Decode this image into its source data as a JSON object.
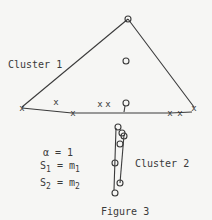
{
  "figure": {
    "caption": "Figure 3",
    "cluster1_label": "Cluster 1",
    "cluster2_label": "Cluster 2",
    "params": {
      "alpha": "α = 1",
      "s1_base": "S",
      "s1_sub": "1",
      "s1_eq": " = m",
      "s1_rhs_sub": "1",
      "s2_base": "S",
      "s2_sub": "2",
      "s2_eq": " = m",
      "s2_rhs_sub": "2"
    },
    "colors": {
      "ink": "#3a3a3a",
      "background": "#f6f6f4"
    },
    "cluster1": {
      "triangle": [
        [
          128,
          19
        ],
        [
          22,
          107
        ],
        [
          194,
          107
        ]
      ],
      "base_line": [
        [
          22,
          108
        ],
        [
          72,
          113
        ],
        [
          192,
          112
        ]
      ],
      "x_marks": [
        [
          22,
          108
        ],
        [
          56,
          102
        ],
        [
          73,
          113
        ],
        [
          100,
          104
        ],
        [
          108,
          104
        ],
        [
          170,
          113
        ],
        [
          180,
          113
        ],
        [
          194,
          108
        ]
      ],
      "circles": [
        [
          128,
          19
        ],
        [
          126,
          61
        ],
        [
          126,
          103
        ]
      ]
    },
    "cluster2": {
      "circles": [
        [
          118,
          127
        ],
        [
          122,
          133
        ],
        [
          124,
          136
        ],
        [
          120,
          144
        ],
        [
          115,
          163
        ],
        [
          120,
          183
        ],
        [
          115,
          193
        ]
      ],
      "lines": [
        [
          [
            116,
            128
          ],
          [
            114,
            190
          ]
        ],
        [
          [
            124,
            135
          ],
          [
            120,
            183
          ]
        ]
      ]
    }
  }
}
